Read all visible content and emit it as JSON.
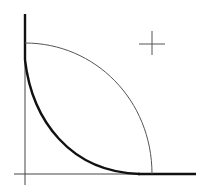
{
  "diagram": {
    "type": "line-drawing",
    "background": "#ffffff",
    "stroke_color": "#111111",
    "thin_stroke_color": "#555555",
    "axes": {
      "vertical": {
        "x": 25,
        "y1": 14,
        "y2": 185
      },
      "horizontal": {
        "y": 174,
        "x1": 14,
        "x2": 196
      }
    },
    "thin_arc": {
      "description": "quarter-ellipse arc, convex outward",
      "start": [
        25,
        43
      ],
      "end": [
        152,
        174
      ]
    },
    "thick_curve": {
      "description": "concave curve hugging both axes",
      "start": [
        25,
        60
      ],
      "end": [
        140,
        174
      ]
    },
    "crosshair": {
      "cx": 152,
      "cy": 44,
      "arm": 13
    }
  }
}
